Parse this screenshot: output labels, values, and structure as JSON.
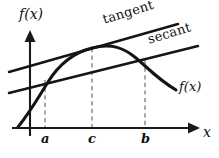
{
  "figure": {
    "kind": "calculus-diagram",
    "background_color": "#ffffff",
    "ink_color": "#151515",
    "dash_color": "#8c8c8c",
    "axes": {
      "y_axis_label": "f(x)",
      "x_axis_label": "x",
      "origin_px": [
        30,
        128
      ],
      "y_axis_top_px": [
        30,
        33
      ],
      "x_axis_right_px": [
        196,
        128
      ]
    },
    "curve": {
      "label": "f(x)",
      "description": "concave curve rising steeply from lower left, peaking near c-to-b, then descending to the lower right"
    },
    "lines": [
      {
        "name": "tangent",
        "label": "tangent",
        "touch_point": "c",
        "start_px": [
          9,
          72
        ],
        "end_px": [
          178,
          24
        ]
      },
      {
        "name": "secant",
        "label": "secant",
        "through_points": [
          "a",
          "b"
        ],
        "start_px": [
          9,
          93
        ],
        "end_px": [
          198,
          46
        ]
      }
    ],
    "x_ticks": [
      {
        "id": "a",
        "label": "a",
        "x_px": 45,
        "drop_top_px": 80
      },
      {
        "id": "c",
        "label": "c",
        "x_px": 92,
        "drop_top_px": 48
      },
      {
        "id": "b",
        "label": "b",
        "x_px": 145,
        "drop_top_px": 60
      }
    ]
  }
}
